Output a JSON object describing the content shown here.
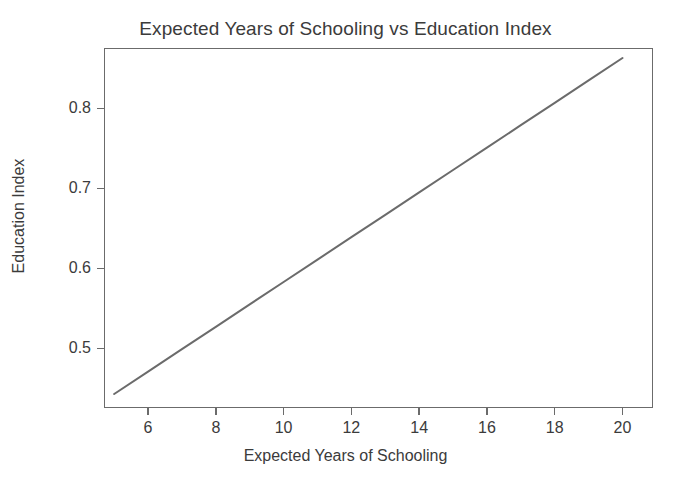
{
  "chart_data": {
    "type": "line",
    "title": "Expected Years of Schooling vs Education Index",
    "xlabel": "Expected Years of Schooling",
    "ylabel": "Education Index",
    "x": [
      5,
      6,
      7,
      8,
      9,
      10,
      11,
      12,
      13,
      14,
      15,
      16,
      17,
      18,
      19,
      20
    ],
    "values": [
      0.443,
      0.471,
      0.499,
      0.527,
      0.555,
      0.583,
      0.611,
      0.639,
      0.667,
      0.695,
      0.723,
      0.751,
      0.779,
      0.807,
      0.835,
      0.863
    ],
    "series": [
      {
        "name": "Education Index",
        "values": [
          0.443,
          0.471,
          0.499,
          0.527,
          0.555,
          0.583,
          0.611,
          0.639,
          0.667,
          0.695,
          0.723,
          0.751,
          0.779,
          0.807,
          0.835,
          0.863
        ]
      }
    ],
    "xlim": [
      4.7,
      20.9
    ],
    "ylim": [
      0.4255,
      0.8755
    ],
    "xticks": [
      6,
      8,
      10,
      12,
      14,
      16,
      18,
      20
    ],
    "xtick_labels": [
      "6",
      "8",
      "10",
      "12",
      "14",
      "16",
      "18",
      "20"
    ],
    "yticks": [
      0.5,
      0.6,
      0.7,
      0.8
    ],
    "ytick_labels": [
      "0.5",
      "0.6",
      "0.7",
      "0.8"
    ],
    "grid": false,
    "legend": false,
    "legend_position": "none",
    "line_color": "#6b6b6b",
    "line_width": 2,
    "frame_color": "#6b6b6b",
    "background_color": "#ffffff",
    "text_color": "#3b3b3b",
    "annotations": []
  }
}
